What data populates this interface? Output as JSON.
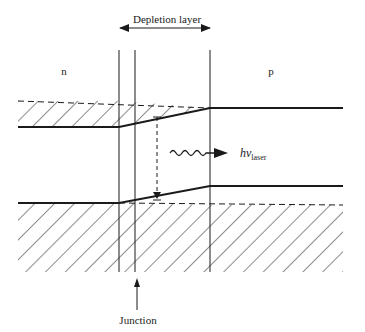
{
  "diagram": {
    "title_label": "Depletion layer",
    "n_region_label": "n",
    "p_region_label": "p",
    "photon_label_main": "hν",
    "photon_label_sub": "laser",
    "junction_label": "Junction",
    "colors": {
      "line": "#1a1a1a",
      "background": "#ffffff"
    }
  }
}
